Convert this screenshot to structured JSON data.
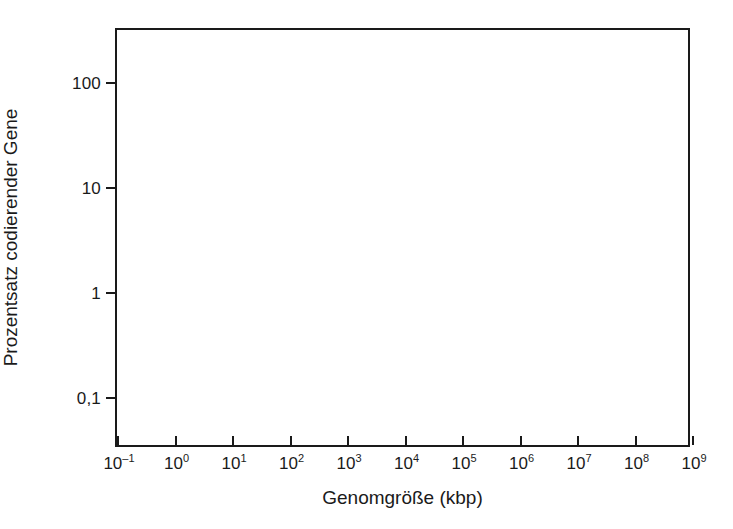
{
  "chart_data": {
    "type": "scatter",
    "title": "",
    "subtitle": "",
    "xlabel": "Genomgröße (kbp)",
    "ylabel": "Prozentsatz codierender Gene",
    "xscale": "log",
    "yscale": "log",
    "xlim": [
      0.1,
      1000000000
    ],
    "ylim": [
      0.0316,
      316
    ],
    "grid": false,
    "legend": null,
    "x_tick_labels": [
      {
        "mantissa": "10",
        "exponent": "–1",
        "value": 0.1
      },
      {
        "mantissa": "10",
        "exponent": "0",
        "value": 1
      },
      {
        "mantissa": "10",
        "exponent": "1",
        "value": 10
      },
      {
        "mantissa": "10",
        "exponent": "2",
        "value": 100
      },
      {
        "mantissa": "10",
        "exponent": "3",
        "value": 1000
      },
      {
        "mantissa": "10",
        "exponent": "4",
        "value": 10000
      },
      {
        "mantissa": "10",
        "exponent": "5",
        "value": 100000
      },
      {
        "mantissa": "10",
        "exponent": "6",
        "value": 1000000
      },
      {
        "mantissa": "10",
        "exponent": "7",
        "value": 10000000
      },
      {
        "mantissa": "10",
        "exponent": "8",
        "value": 100000000
      },
      {
        "mantissa": "10",
        "exponent": "9",
        "value": 1000000000
      }
    ],
    "y_tick_labels": [
      {
        "label": "100",
        "value": 100
      },
      {
        "label": "10",
        "value": 10
      },
      {
        "label": "1",
        "value": 1
      },
      {
        "label": "0,1",
        "value": 0.1
      }
    ],
    "series": [],
    "values": [],
    "categories": [],
    "annotations": [],
    "axis_color": "#1a1a1a",
    "background_color": "#ffffff"
  }
}
